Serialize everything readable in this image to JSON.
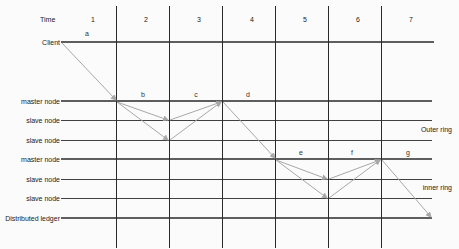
{
  "header": {
    "time_label": "Time",
    "time_slots": [
      "1",
      "2",
      "3",
      "4",
      "5",
      "6",
      "7"
    ]
  },
  "rows": [
    {
      "label": "Client",
      "type": "client"
    },
    {
      "label": "master node",
      "type": "master"
    },
    {
      "label": "slave node",
      "type": "slave"
    },
    {
      "label": "slave node",
      "type": "slave"
    },
    {
      "label": "master node",
      "type": "master"
    },
    {
      "label": "slave node",
      "type": "slave"
    },
    {
      "label": "slave node",
      "type": "slave"
    },
    {
      "label": "Distributed ledger",
      "type": "ledger"
    }
  ],
  "ring_labels": {
    "outer": "Outer ring",
    "inner": "inner ring"
  },
  "step_labels": [
    "a",
    "b",
    "c",
    "d",
    "e",
    "f",
    "g"
  ],
  "colors": {
    "grid": "#2a2a2a",
    "arrow": "#a8a8a8",
    "background": "#fbfbfb"
  }
}
